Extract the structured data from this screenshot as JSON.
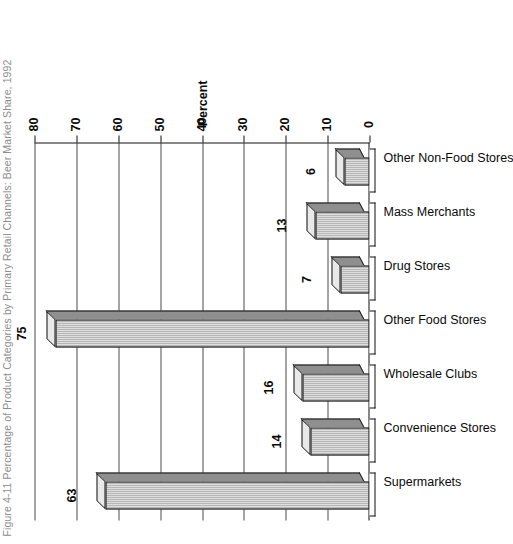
{
  "title": "Figure 4-11  Percentage of Product Categories by Primary Retail Channels: Beer Market Share, 1992",
  "chart_data": {
    "type": "bar",
    "title": "Figure 4-11  Percentage of Product Categories by Primary Retail Channels: Beer Market Share, 1992",
    "orientation": "vertical-3d",
    "categories": [
      "Supermarkets",
      "Convenience Stores",
      "Wholesale Clubs",
      "Other Food Stores",
      "Drug Stores",
      "Mass Merchants",
      "Other Non-Food Stores"
    ],
    "values": [
      63,
      14,
      16,
      75,
      7,
      13,
      6
    ],
    "value_labels": [
      "63",
      "14",
      "16",
      "75",
      "7",
      "13",
      "6"
    ],
    "xlabel": "",
    "ylabel": "Percent",
    "ylim": [
      0,
      80
    ],
    "yticks": [
      0,
      10,
      20,
      30,
      40,
      50,
      60,
      70,
      80
    ],
    "ytick_labels": [
      "0",
      "10",
      "20",
      "30",
      "40",
      "50",
      "60",
      "70",
      "80"
    ],
    "grid": true,
    "grid_axis": "y",
    "legend": null,
    "series_fill": "#9b9b9b",
    "axis_color": "#111111",
    "page_rotation_degrees": -90
  }
}
